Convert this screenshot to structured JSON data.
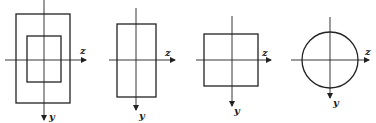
{
  "diagram": {
    "figures": [
      {
        "id": "hollow-rectangle",
        "shape": "rectangle with rectangular cutout",
        "axis_labels": {
          "horizontal": "z",
          "vertical": "y"
        }
      },
      {
        "id": "tall-rectangle",
        "shape": "rectangle",
        "axis_labels": {
          "horizontal": "z",
          "vertical": "y"
        }
      },
      {
        "id": "square",
        "shape": "square",
        "axis_labels": {
          "horizontal": "z",
          "vertical": "y"
        }
      },
      {
        "id": "circle",
        "shape": "circle",
        "axis_labels": {
          "horizontal": "z",
          "vertical": "y"
        }
      }
    ],
    "line_color": "#222222",
    "background": "#ffffff"
  }
}
